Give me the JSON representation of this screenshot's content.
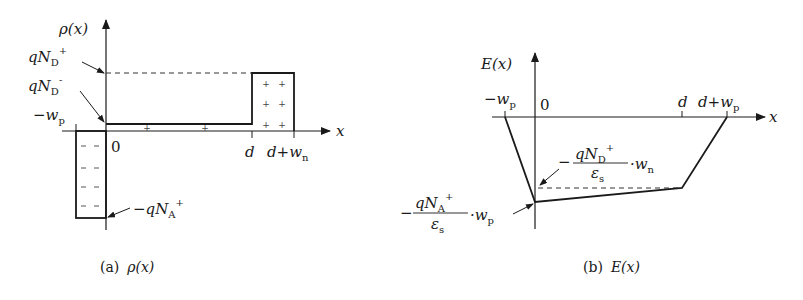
{
  "figure_a": {
    "caption_tag": "(a)",
    "caption_expr": "ρ(x)",
    "y_axis_label": "ρ(x)",
    "x_axis_label": "x",
    "labels": {
      "qND_plus": {
        "main": "qN",
        "sub": "D",
        "sup": "+"
      },
      "qND_minus": {
        "main": "qN",
        "sub": "D",
        "sup": "-"
      },
      "neg_wp": {
        "main": "−w",
        "sub": "p"
      },
      "origin": "0",
      "d": "d",
      "d_plus_wn": {
        "main": "d+w",
        "sub": "n"
      },
      "neg_qNA_plus": {
        "main": "−qN",
        "sub": "A",
        "sup": "+"
      }
    },
    "regions": [
      {
        "name": "p-region",
        "x_from": "-w_p",
        "x_to": "0",
        "level": "-qN_A+",
        "fill_symbol": "−"
      },
      {
        "name": "intrinsic-region",
        "x_from": "0",
        "x_to": "d",
        "level": "qN_D-",
        "fill_symbol": "+"
      },
      {
        "name": "n-region",
        "x_from": "d",
        "x_to": "d+w_n",
        "level": "qN_D+",
        "fill_symbol": "+"
      }
    ]
  },
  "figure_b": {
    "caption_tag": "(b)",
    "caption_expr": "E(x)",
    "y_axis_label": "E(x)",
    "x_axis_label": "x",
    "labels": {
      "neg_wp": {
        "main": "−w",
        "sub": "p"
      },
      "origin": "0",
      "d": "d",
      "d_plus_wp": {
        "main": "d+w",
        "sub": "p"
      },
      "upper_annot": {
        "sign": "−",
        "num_main": "qN",
        "num_sub": "D",
        "num_sup": "+",
        "den_main": "ε",
        "den_sub": "s",
        "factor_main": "·w",
        "factor_sub": "n"
      },
      "lower_annot": {
        "sign": "−",
        "num_main": "qN",
        "num_sub": "A",
        "num_sup": "+",
        "den_main": "ε",
        "den_sub": "s",
        "factor_main": "·w",
        "factor_sub": "p"
      }
    },
    "profile_points": [
      {
        "x": "-w_p",
        "E": "0"
      },
      {
        "x": "0",
        "E": "-(qN_A+/ε_s)·w_p"
      },
      {
        "x": "d",
        "E": "-(qN_D+/ε_s)·w_n"
      },
      {
        "x": "d+w_p",
        "E": "0"
      }
    ]
  }
}
